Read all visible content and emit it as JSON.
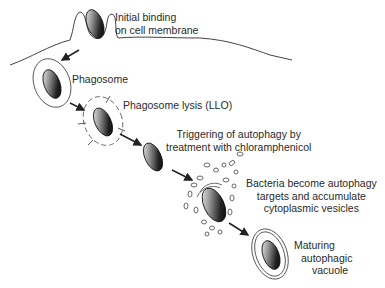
{
  "diagram": {
    "colors": {
      "line": "#333333",
      "text": "#2a2a2a",
      "background": "#ffffff"
    },
    "steps": [
      {
        "id": "binding",
        "lines": [
          "Initial binding",
          "on cell membrane"
        ]
      },
      {
        "id": "phagosome",
        "lines": [
          "Phagosome"
        ]
      },
      {
        "id": "lysis",
        "lines": [
          "Phagosome lysis (LLO)"
        ]
      },
      {
        "id": "trigger",
        "lines": [
          "Triggering of autophagy by",
          "treatment with chloramphenicol"
        ]
      },
      {
        "id": "targets",
        "lines": [
          "Bacteria become autophagy",
          "targets and accumulate",
          "cytoplasmic vesicles"
        ]
      },
      {
        "id": "vacuole",
        "lines": [
          "Maturing",
          "autophagic",
          "vacuole"
        ]
      }
    ]
  }
}
